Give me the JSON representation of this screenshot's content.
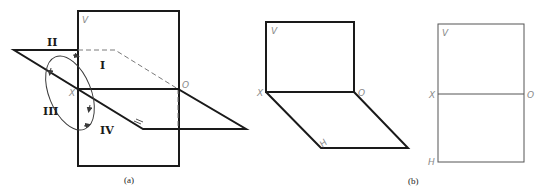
{
  "figure_a": {
    "caption": "(a)",
    "labels": {
      "V": "V",
      "X": "X",
      "O": "O",
      "H": "H"
    },
    "quadrants": {
      "q1": "I",
      "q2": "II",
      "q3": "III",
      "q4": "IV"
    }
  },
  "figure_b": {
    "caption": "(b)",
    "opened_view": {
      "V": "V",
      "X": "X",
      "O": "O",
      "H": "H"
    },
    "flat_view": {
      "V": "V",
      "X": "X",
      "O": "O",
      "H": "H"
    }
  },
  "colors": {
    "line": "#1a1a1a",
    "label": "#8a8a8a",
    "dashed": "#7a7a7a"
  }
}
